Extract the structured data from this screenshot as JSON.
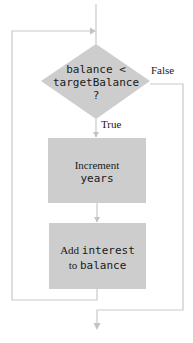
{
  "diagram": {
    "type": "flowchart",
    "title": "",
    "colors": {
      "shape_fill": "#cdcdcd",
      "line": "#c9c9c9",
      "text": "#1a1a1a",
      "background": "#ffffff"
    },
    "decision": {
      "id": "condition",
      "shape": "diamond",
      "line1": "balance <",
      "line2": "targetBalance",
      "line3": "?"
    },
    "branches": {
      "true_label": "True",
      "false_label": "False"
    },
    "process_1": {
      "id": "increment-years",
      "shape": "rectangle",
      "line1": "Increment",
      "line2": "years"
    },
    "process_2": {
      "id": "add-interest",
      "shape": "rectangle",
      "line1_plain": "Add ",
      "line1_code": "interest",
      "line2_plain": "to ",
      "line2_code": "balance"
    },
    "edges": [
      {
        "from": "entry",
        "to": "condition"
      },
      {
        "from": "condition",
        "to": "increment-years",
        "label": "True"
      },
      {
        "from": "increment-years",
        "to": "add-interest"
      },
      {
        "from": "add-interest",
        "to": "condition",
        "label": "loop back"
      },
      {
        "from": "condition",
        "to": "exit",
        "label": "False"
      }
    ]
  }
}
